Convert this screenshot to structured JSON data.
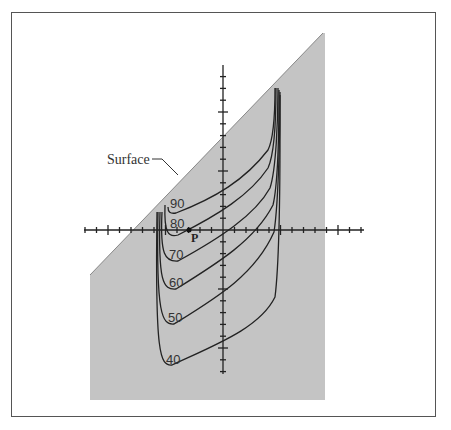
{
  "diagram": {
    "surface_label": "Surface",
    "point_label": "P",
    "fill_color": "#c4c4c4",
    "curve_color": "#222222",
    "contours": [
      {
        "label": "90",
        "value": 90
      },
      {
        "label": "80",
        "value": 80
      },
      {
        "label": "70",
        "value": 70
      },
      {
        "label": "60",
        "value": 60
      },
      {
        "label": "50",
        "value": 50
      },
      {
        "label": "40",
        "value": 40
      }
    ]
  }
}
